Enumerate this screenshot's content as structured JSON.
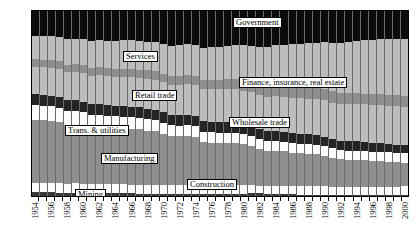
{
  "chart_data": {
    "type": "area",
    "title": "",
    "subtitle": "",
    "xlabel": "",
    "ylabel": "",
    "ylim": [
      0,
      100
    ],
    "ytick_labels": [
      "0%",
      "10%",
      "20%",
      "30%",
      "40%",
      "50%",
      "60%",
      "70%",
      "80%",
      "90%",
      "100%"
    ],
    "ytick_values": [
      0,
      10,
      20,
      30,
      40,
      50,
      60,
      70,
      80,
      90,
      100
    ],
    "grid": false,
    "legend_position": "inline-callouts",
    "stacked": true,
    "stack_order_bottom_to_top": [
      "Mining",
      "Construction",
      "Manufacturing",
      "Trans. & utilities",
      "Wholesale trade",
      "Retail trade",
      "Finance, insurance, real estate",
      "Services",
      "Government"
    ],
    "x": [
      1954,
      1955,
      1956,
      1957,
      1958,
      1959,
      1960,
      1961,
      1962,
      1963,
      1964,
      1965,
      1966,
      1967,
      1968,
      1969,
      1970,
      1971,
      1972,
      1973,
      1974,
      1975,
      1976,
      1977,
      1978,
      1979,
      1980,
      1981,
      1982,
      1983,
      1984,
      1985,
      1986,
      1987,
      1988,
      1989,
      1990,
      1991,
      1992,
      1993,
      1994,
      1995,
      1996,
      1997,
      1998,
      1999,
      2000
    ],
    "xtick_labels": [
      "1954",
      "1956",
      "1958",
      "1960",
      "1962",
      "1964",
      "1966",
      "1968",
      "1970",
      "1972",
      "1974",
      "1976",
      "1978",
      "1980",
      "1982",
      "1984",
      "1986",
      "1988",
      "1990",
      "1992",
      "1994",
      "1996",
      "1998",
      "2000"
    ],
    "xtick_every": 2,
    "series": [
      {
        "name": "Mining",
        "color": "#3a3a3a",
        "values": [
          2.0,
          2.0,
          2.0,
          1.9,
          1.8,
          1.7,
          1.7,
          1.6,
          1.6,
          1.5,
          1.5,
          1.4,
          1.4,
          1.3,
          1.3,
          1.2,
          1.2,
          1.1,
          1.1,
          1.1,
          1.1,
          1.2,
          1.2,
          1.2,
          1.2,
          1.2,
          1.3,
          1.4,
          1.4,
          1.2,
          1.1,
          1.0,
          0.9,
          0.8,
          0.8,
          0.8,
          0.8,
          0.7,
          0.7,
          0.6,
          0.6,
          0.6,
          0.5,
          0.5,
          0.5,
          0.4,
          0.4
        ]
      },
      {
        "name": "Construction",
        "color": "#fdfdfd",
        "values": [
          5.0,
          5.0,
          5.0,
          5.0,
          4.9,
          5.1,
          5.0,
          4.9,
          4.9,
          4.9,
          4.9,
          4.9,
          4.8,
          4.7,
          4.7,
          4.8,
          4.8,
          4.7,
          4.8,
          4.9,
          4.9,
          4.5,
          4.4,
          4.5,
          4.7,
          4.9,
          4.8,
          4.6,
          4.2,
          4.1,
          4.3,
          4.5,
          4.6,
          4.7,
          4.8,
          4.8,
          4.7,
          4.4,
          4.1,
          4.1,
          4.2,
          4.3,
          4.4,
          4.5,
          4.6,
          4.7,
          4.8
        ]
      },
      {
        "name": "Manufacturing",
        "color": "#8e8e8e",
        "values": [
          34.0,
          34.0,
          33.6,
          33.2,
          31.8,
          31.8,
          31.3,
          30.5,
          30.6,
          30.4,
          30.0,
          30.0,
          30.2,
          30.0,
          29.4,
          29.0,
          27.6,
          26.5,
          26.3,
          26.4,
          25.9,
          23.4,
          23.2,
          23.0,
          22.8,
          22.6,
          21.8,
          21.2,
          19.9,
          19.2,
          19.1,
          18.6,
          18.0,
          17.6,
          17.3,
          16.9,
          16.3,
          15.6,
          15.2,
          14.9,
          14.8,
          14.5,
          14.1,
          13.8,
          13.5,
          13.1,
          12.8
        ]
      },
      {
        "name": "Trans. & utilities",
        "color": "#fdfdfd",
        "values": [
          8.0,
          7.9,
          7.8,
          7.7,
          7.4,
          7.3,
          7.2,
          7.0,
          6.9,
          6.7,
          6.6,
          6.5,
          6.4,
          6.3,
          6.2,
          6.1,
          6.0,
          5.9,
          5.8,
          5.8,
          5.8,
          5.7,
          5.6,
          5.6,
          5.6,
          5.6,
          5.5,
          5.4,
          5.3,
          5.2,
          5.2,
          5.2,
          5.1,
          5.1,
          5.1,
          5.1,
          5.1,
          5.0,
          5.0,
          5.0,
          5.0,
          5.0,
          5.0,
          5.0,
          5.0,
          5.0,
          5.0
        ]
      },
      {
        "name": "Wholesale trade",
        "color": "#242424",
        "values": [
          6.0,
          5.9,
          5.9,
          5.9,
          5.8,
          5.8,
          5.8,
          5.7,
          5.7,
          5.6,
          5.6,
          5.6,
          5.6,
          5.6,
          5.6,
          5.6,
          5.6,
          5.6,
          5.6,
          5.7,
          5.7,
          5.6,
          5.6,
          5.6,
          5.6,
          5.6,
          5.6,
          5.5,
          5.5,
          5.4,
          5.4,
          5.4,
          5.3,
          5.3,
          5.3,
          5.2,
          5.2,
          5.1,
          5.0,
          4.9,
          4.9,
          4.8,
          4.8,
          4.7,
          4.6,
          4.5,
          4.4
        ]
      },
      {
        "name": "Retail trade",
        "color": "#bdbdbd",
        "values": [
          15.0,
          15.0,
          15.1,
          15.1,
          15.2,
          15.3,
          15.4,
          15.4,
          15.5,
          15.6,
          15.7,
          15.8,
          15.8,
          15.9,
          16.0,
          16.1,
          16.2,
          16.4,
          16.5,
          16.6,
          16.7,
          17.4,
          17.6,
          17.7,
          17.8,
          17.9,
          18.0,
          18.1,
          18.3,
          18.6,
          18.8,
          19.0,
          19.2,
          19.3,
          19.4,
          19.5,
          19.6,
          19.7,
          19.8,
          20.0,
          20.2,
          20.3,
          20.4,
          20.5,
          20.6,
          20.8,
          21.0
        ]
      },
      {
        "name": "Finance, insurance, real estate",
        "color": "#8e8e8e",
        "values": [
          4.0,
          4.0,
          4.1,
          4.1,
          4.2,
          4.2,
          4.3,
          4.3,
          4.4,
          4.4,
          4.5,
          4.5,
          4.6,
          4.6,
          4.7,
          4.7,
          4.8,
          4.8,
          4.9,
          4.9,
          5.0,
          5.2,
          5.3,
          5.3,
          5.4,
          5.4,
          5.5,
          5.6,
          5.7,
          5.8,
          5.9,
          6.0,
          6.1,
          6.2,
          6.2,
          6.2,
          6.2,
          6.1,
          6.0,
          6.0,
          5.9,
          5.9,
          5.9,
          5.9,
          5.9,
          5.9,
          5.9
        ]
      },
      {
        "name": "Services",
        "color": "#bdbdbd",
        "values": [
          12.5,
          12.7,
          12.9,
          13.1,
          13.6,
          13.8,
          14.1,
          14.4,
          14.6,
          14.9,
          15.2,
          15.4,
          15.3,
          15.4,
          15.6,
          15.8,
          16.1,
          16.3,
          16.5,
          16.6,
          16.8,
          17.3,
          17.5,
          17.8,
          18.0,
          18.3,
          18.9,
          19.5,
          20.4,
          21.2,
          21.7,
          22.2,
          22.9,
          23.4,
          23.9,
          24.5,
          25.2,
          26.1,
          27.0,
          27.7,
          28.2,
          28.8,
          29.3,
          29.8,
          30.1,
          30.4,
          30.5
        ]
      },
      {
        "name": "Government",
        "color": "#0a0a0a",
        "values": [
          13.5,
          13.5,
          13.6,
          14.0,
          15.3,
          15.0,
          15.2,
          16.1,
          15.8,
          16.0,
          16.0,
          15.9,
          15.9,
          16.2,
          16.5,
          16.7,
          17.7,
          18.7,
          18.5,
          18.0,
          18.1,
          19.7,
          19.6,
          19.3,
          18.9,
          18.5,
          18.6,
          18.7,
          19.3,
          19.3,
          18.5,
          18.1,
          17.9,
          17.6,
          17.2,
          17.0,
          16.9,
          17.3,
          17.2,
          16.8,
          16.2,
          15.8,
          15.6,
          15.3,
          15.2,
          15.2,
          15.2
        ]
      }
    ],
    "callouts": [
      {
        "label": "Government",
        "name": "callout-government",
        "left": 232,
        "top": 16
      },
      {
        "label": "Services",
        "name": "callout-services",
        "left": 122,
        "top": 50
      },
      {
        "label": "Finance, insurance, real estate",
        "name": "callout-finance",
        "left": 238,
        "top": 76
      },
      {
        "label": "Retail trade",
        "name": "callout-retail",
        "left": 131,
        "top": 89
      },
      {
        "label": "Wholesale trade",
        "name": "callout-wholesale",
        "left": 228,
        "top": 116
      },
      {
        "label": "Trans. & utilities",
        "name": "callout-transutil",
        "left": 64,
        "top": 124
      },
      {
        "label": "Manufacturing",
        "name": "callout-manufacturing",
        "left": 100,
        "top": 152
      },
      {
        "label": "Construction",
        "name": "callout-construction",
        "left": 186,
        "top": 178
      },
      {
        "label": "Mining",
        "name": "callout-mining",
        "left": 74,
        "top": 188
      }
    ]
  }
}
